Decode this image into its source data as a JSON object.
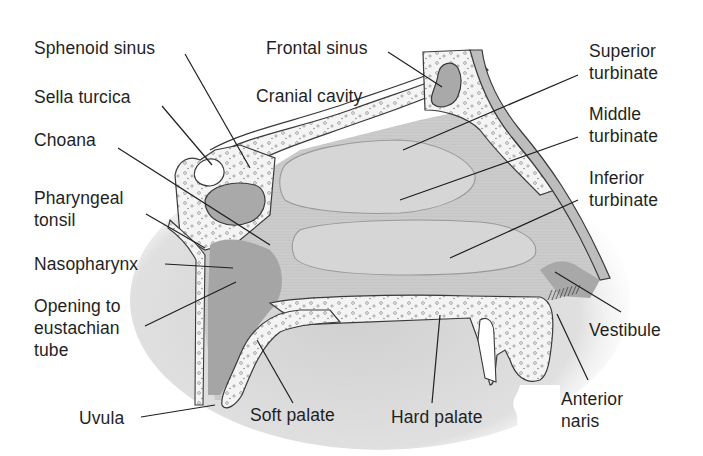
{
  "diagram": {
    "colors": {
      "background": "#ffffff",
      "cavity_fill": "#c9c9c9",
      "turbinate_fill": "#d6d6d6",
      "bone_fill": "#f2f2f2",
      "dark_tissue": "#a8a8a8",
      "outline": "#3a3a3a",
      "label_text": "#1f1f1f",
      "leader_line": "#1f1f1f"
    },
    "labels": {
      "sphenoid_sinus": "Sphenoid sinus",
      "frontal_sinus": "Frontal sinus",
      "sella_turcica": "Sella turcica",
      "cranial_cavity": "Cranial cavity",
      "choana": "Choana",
      "pharyngeal_tonsil_1": "Pharyngeal",
      "pharyngeal_tonsil_2": "tonsil",
      "nasopharynx": "Nasopharynx",
      "eustachian_1": "Opening to",
      "eustachian_2": "eustachian",
      "eustachian_3": "tube",
      "uvula": "Uvula",
      "soft_palate": "Soft palate",
      "hard_palate": "Hard palate",
      "superior_turbinate_1": "Superior",
      "superior_turbinate_2": "turbinate",
      "middle_turbinate_1": "Middle",
      "middle_turbinate_2": "turbinate",
      "inferior_turbinate_1": "Inferior",
      "inferior_turbinate_2": "turbinate",
      "vestibule": "Vestibule",
      "anterior_naris_1": "Anterior",
      "anterior_naris_2": "naris"
    }
  }
}
